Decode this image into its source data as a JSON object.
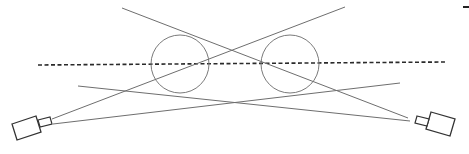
{
  "diagram": {
    "title": "",
    "colors": {
      "background": "#ffffff",
      "ray": "#6e6e6e",
      "circle": "#7a7a7a",
      "dashed_axis": "#2a2a2a",
      "camera": "#333333",
      "corner_mark": "#222222"
    },
    "objects": [
      {
        "id": "circle-left",
        "cx": 180,
        "cy": 64,
        "r": 29
      },
      {
        "id": "circle-right",
        "cx": 290,
        "cy": 64,
        "r": 29
      }
    ],
    "axis": {
      "x1": 38,
      "y1": 65,
      "x2": 445,
      "y2": 62
    },
    "rays": [
      {
        "id": "ray-a",
        "x1": 122,
        "y1": 8,
        "x2": 408,
        "y2": 118
      },
      {
        "id": "ray-b",
        "x1": 345,
        "y1": 7,
        "x2": 52,
        "y2": 119
      },
      {
        "id": "ray-c",
        "x1": 78,
        "y1": 86,
        "x2": 410,
        "y2": 121
      },
      {
        "id": "ray-d",
        "x1": 53,
        "y1": 124,
        "x2": 400,
        "y2": 83
      }
    ],
    "cameras": [
      {
        "id": "camera-left",
        "side": "left"
      },
      {
        "id": "camera-right",
        "side": "right"
      }
    ]
  }
}
